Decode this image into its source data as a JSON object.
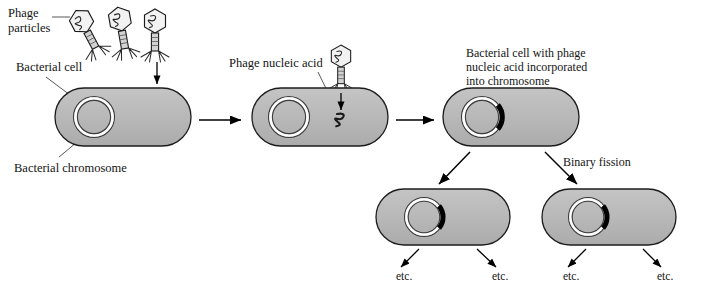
{
  "figure": {
    "background_color": "#ffffff",
    "cell_fill": "#b9b9b9",
    "cell_stroke": "#1a1a1a",
    "prophage_color": "#000000",
    "arrow_color": "#000000",
    "text_color": "#141414"
  },
  "labels": {
    "phage_particles_line1": "Phage",
    "phage_particles_line2": "particles",
    "bacterial_cell": "Bacterial cell",
    "bacterial_chromosome": "Bacterial chromosome",
    "phage_nucleic_acid": "Phage nucleic acid",
    "incorporated_line1": "Bacterial cell with phage",
    "incorporated_line2": "nucleic acid incorporated",
    "incorporated_line3": "into chromosome",
    "binary_fission": "Binary fission"
  },
  "etc_labels": [
    {
      "text": "etc.",
      "x": 396,
      "y": 277
    },
    {
      "text": "etc.",
      "x": 492,
      "y": 277
    },
    {
      "text": "etc.",
      "x": 563,
      "y": 277
    },
    {
      "text": "etc.",
      "x": 657,
      "y": 277
    }
  ],
  "cells": [
    {
      "id": "cell-1-uninfected",
      "x": 55,
      "y": 88,
      "w": 136,
      "h": 58,
      "chromosome_cx": 94,
      "chromosome_cy": 117,
      "chromosome_r": 20,
      "has_prophage": false
    },
    {
      "id": "cell-2-injected",
      "x": 252,
      "y": 88,
      "w": 136,
      "h": 58,
      "chromosome_cx": 289,
      "chromosome_cy": 117,
      "chromosome_r": 20,
      "has_prophage": false
    },
    {
      "id": "cell-3-lysogen",
      "x": 443,
      "y": 88,
      "w": 136,
      "h": 58,
      "chromosome_cx": 482,
      "chromosome_cy": 117,
      "chromosome_r": 20,
      "has_prophage": true
    },
    {
      "id": "cell-4-daughter-left",
      "x": 376,
      "y": 189,
      "w": 134,
      "h": 56,
      "chromosome_cx": 424,
      "chromosome_cy": 217,
      "chromosome_r": 19,
      "has_prophage": true
    },
    {
      "id": "cell-5-daughter-right",
      "x": 542,
      "y": 189,
      "w": 134,
      "h": 56,
      "chromosome_cx": 588,
      "chromosome_cy": 217,
      "chromosome_r": 19,
      "has_prophage": true
    }
  ],
  "phages": [
    {
      "id": "phage-1",
      "head_cx": 82,
      "head_cy": 22,
      "rotation": -28
    },
    {
      "id": "phage-2",
      "head_cx": 120,
      "head_cy": 20,
      "rotation": -10
    },
    {
      "id": "phage-3",
      "head_cx": 155,
      "head_cy": 22,
      "rotation": 0
    },
    {
      "id": "phage-4",
      "head_cx": 341,
      "head_cy": 57,
      "rotation": 0
    }
  ],
  "arrows": [
    {
      "id": "arrow-stage1-to-stage2",
      "x1": 199,
      "y1": 120,
      "x2": 243,
      "y2": 120
    },
    {
      "id": "arrow-stage2-to-stage3",
      "x1": 396,
      "y1": 120,
      "x2": 436,
      "y2": 120
    },
    {
      "id": "arrow-injection-cell1",
      "x1": 157,
      "y1": 63,
      "x2": 157,
      "y2": 85
    },
    {
      "id": "arrow-injection-cell2",
      "x1": 341,
      "y1": 92,
      "x2": 341,
      "y2": 110
    },
    {
      "id": "arrow-division-left",
      "x1": 470,
      "y1": 152,
      "x2": 438,
      "y2": 185
    },
    {
      "id": "arrow-division-right",
      "x1": 545,
      "y1": 152,
      "x2": 578,
      "y2": 185
    },
    {
      "id": "arrow-etc-1",
      "x1": 418,
      "y1": 248,
      "x2": 400,
      "y2": 268
    },
    {
      "id": "arrow-etc-2",
      "x1": 478,
      "y1": 248,
      "x2": 497,
      "y2": 268
    },
    {
      "id": "arrow-etc-3",
      "x1": 585,
      "y1": 248,
      "x2": 567,
      "y2": 268
    },
    {
      "id": "arrow-etc-4",
      "x1": 644,
      "y1": 248,
      "x2": 662,
      "y2": 268
    }
  ],
  "leader_lines": [
    {
      "id": "leader-phage-particles",
      "x1": 58,
      "y1": 17,
      "x2": 70,
      "y2": 17
    },
    {
      "id": "leader-bacterial-cell",
      "x1": 46,
      "y1": 77,
      "x2": 72,
      "y2": 97
    },
    {
      "id": "leader-bacterial-chromosome",
      "x1": 58,
      "y1": 158,
      "x2": 86,
      "y2": 133
    },
    {
      "id": "leader-phage-nucleic-acid",
      "x1": 318,
      "y1": 72,
      "x2": 338,
      "y2": 110
    }
  ],
  "nucleic_acid": {
    "id": "injected-nucleic-acid",
    "cx": 341,
    "cy": 120
  }
}
